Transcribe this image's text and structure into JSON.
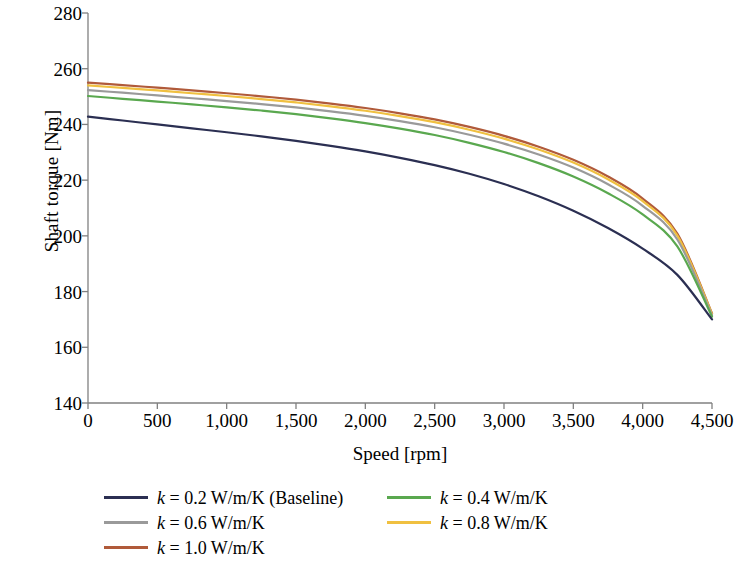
{
  "chart_data": {
    "type": "line",
    "title": "",
    "xlabel": "Speed [rpm]",
    "ylabel": "Shaft torque [Nm]",
    "xlim": [
      0,
      4500
    ],
    "ylim": [
      140,
      280
    ],
    "xticks": [
      "0",
      "500",
      "1,000",
      "1,500",
      "2,000",
      "2,500",
      "3,000",
      "3,500",
      "4,000",
      "4,500"
    ],
    "xtick_values": [
      0,
      500,
      1000,
      1500,
      2000,
      2500,
      3000,
      3500,
      4000,
      4500
    ],
    "yticks": [
      "140",
      "160",
      "180",
      "200",
      "220",
      "240",
      "260",
      "280"
    ],
    "ytick_values": [
      140,
      160,
      180,
      200,
      220,
      240,
      260,
      280
    ],
    "grid": false,
    "legend_position": "below-axes",
    "legend_columns": 2,
    "x": [
      0,
      250,
      500,
      750,
      1000,
      1250,
      1500,
      1750,
      2000,
      2250,
      2500,
      2750,
      3000,
      3250,
      3500,
      3750,
      4000,
      4250,
      4500
    ],
    "series": [
      {
        "name": "k = 0.2 W/m/K (Baseline)",
        "k": 0.2,
        "color": "#2b2f52",
        "values": [
          242.8,
          241.4,
          240.0,
          238.6,
          237.2,
          235.7,
          234.1,
          232.3,
          230.3,
          228.0,
          225.4,
          222.3,
          218.6,
          214.2,
          209.0,
          202.8,
          195.4,
          186.0,
          170.0
        ]
      },
      {
        "name": "k = 0.4 W/m/K",
        "k": 0.4,
        "color": "#5aa84f",
        "values": [
          250.2,
          249.2,
          248.2,
          247.2,
          246.1,
          245.0,
          243.7,
          242.2,
          240.5,
          238.5,
          236.2,
          233.4,
          230.1,
          226.1,
          221.3,
          215.3,
          207.7,
          196.2,
          171.0
        ]
      },
      {
        "name": "k = 0.6 W/m/K",
        "k": 0.6,
        "color": "#9a9a9a",
        "values": [
          252.3,
          251.4,
          250.4,
          249.4,
          248.4,
          247.3,
          246.1,
          244.7,
          243.1,
          241.2,
          239.0,
          236.3,
          233.1,
          229.2,
          224.5,
          218.5,
          210.8,
          198.7,
          171.5
        ]
      },
      {
        "name": "k = 0.8 W/m/K",
        "k": 0.8,
        "color": "#f0c040",
        "values": [
          254.0,
          253.1,
          252.2,
          251.2,
          250.2,
          249.1,
          247.9,
          246.5,
          244.9,
          243.0,
          240.8,
          238.1,
          234.9,
          231.0,
          226.3,
          220.3,
          212.5,
          200.1,
          172.0
        ]
      },
      {
        "name": "k = 1.0 W/m/K",
        "k": 1.0,
        "color": "#b05a3a",
        "values": [
          255.0,
          254.1,
          253.2,
          252.2,
          251.2,
          250.1,
          248.9,
          247.5,
          245.9,
          244.0,
          241.8,
          239.1,
          235.9,
          232.0,
          227.3,
          221.3,
          213.4,
          200.8,
          172.2
        ]
      }
    ]
  },
  "axes": {
    "axis_color": "#808080",
    "line_width": 2.2
  },
  "legend": {
    "entries": [
      {
        "label_prefix": "k",
        "label_rest": " = 0.2 W/m/K (Baseline)",
        "full": "k = 0.2 W/m/K (Baseline)",
        "color": "#2b2f52"
      },
      {
        "label_prefix": "k",
        "label_rest": " = 0.4 W/m/K",
        "full": "k = 0.4 W/m/K",
        "color": "#5aa84f"
      },
      {
        "label_prefix": "k",
        "label_rest": " = 0.6 W/m/K",
        "full": "k = 0.6 W/m/K",
        "color": "#9a9a9a"
      },
      {
        "label_prefix": "k",
        "label_rest": " = 0.8 W/m/K",
        "full": "k = 0.8 W/m/K",
        "color": "#f0c040"
      },
      {
        "label_prefix": "k",
        "label_rest": " = 1.0 W/m/K",
        "full": "k = 1.0 W/m/K",
        "color": "#b05a3a"
      }
    ]
  }
}
